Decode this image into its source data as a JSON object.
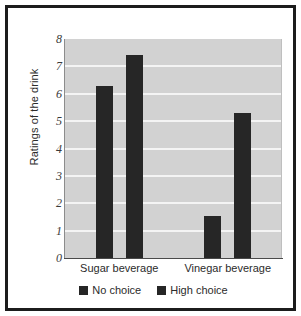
{
  "chart_data": {
    "type": "bar",
    "title": "",
    "xlabel": "",
    "ylabel": "Ratings of the drink",
    "categories": [
      "Sugar beverage",
      "Vinegar beverage"
    ],
    "series": [
      {
        "name": "No choice",
        "values": [
          6.3,
          1.55
        ],
        "color": "#262626"
      },
      {
        "name": "High choice",
        "values": [
          7.4,
          5.3
        ],
        "color": "#262626"
      }
    ],
    "ylim": [
      0,
      8
    ],
    "yticks": [
      "8",
      "7",
      "6",
      "5",
      "4",
      "3",
      "2",
      "1",
      "0"
    ],
    "grid": true,
    "legend_position": "bottom",
    "plot_background": "#d2d2d2",
    "gridline_color": "#f4f4f4",
    "frame_color": "#1c1c1c"
  }
}
